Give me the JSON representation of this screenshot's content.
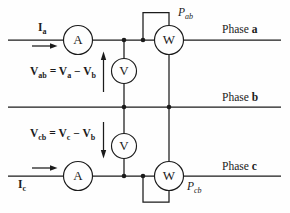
{
  "figure": {
    "colors": {
      "line": "#1b1b1b",
      "background": "#fefefe"
    },
    "phase_labels": [
      {
        "prefix": "Phase ",
        "phase": "a"
      },
      {
        "prefix": "Phase ",
        "phase": "b"
      },
      {
        "prefix": "Phase ",
        "phase": "c"
      }
    ],
    "meters": {
      "ammeter_a": "A",
      "wattmeter_ab": "W",
      "voltmeter_ab": "V",
      "voltmeter_cb": "V",
      "ammeter_c": "A",
      "wattmeter_cb": "W"
    },
    "current_labels": {
      "ia": {
        "base": "I",
        "sub": "a"
      },
      "ic": {
        "base": "I",
        "sub": "c"
      }
    },
    "power_labels": {
      "pab": {
        "base": "P",
        "sub": "ab"
      },
      "pcb": {
        "base": "P",
        "sub": "cb"
      }
    },
    "equation_top": {
      "t0": "V",
      "t1": "ab",
      "t2": " = V",
      "t3": "a",
      "t4": " − V",
      "t5": "b"
    },
    "equation_bottom": {
      "t0": "V",
      "t1": "cb",
      "t2": " = V",
      "t3": "c",
      "t4": " − V",
      "t5": "b"
    }
  }
}
